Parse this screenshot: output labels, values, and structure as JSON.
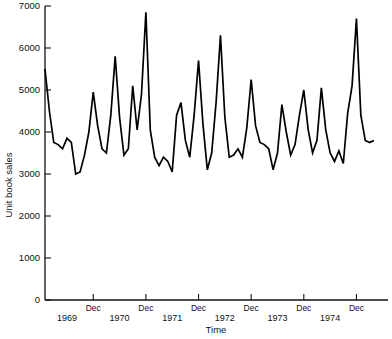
{
  "chart_data": {
    "type": "line",
    "title": "",
    "xlabel": "Time",
    "ylabel": "Unit book sales",
    "ylim": [
      0,
      7000
    ],
    "ytick_values": [
      0,
      1000,
      2000,
      3000,
      4000,
      5000,
      6000,
      7000
    ],
    "ytick_labels": [
      "0",
      "1000",
      "2000",
      "3000",
      "4000",
      "5000",
      "6000",
      "7000"
    ],
    "xtick_labels": [
      "Dec",
      "Dec",
      "Dec",
      "Dec",
      "Dec",
      "Dec"
    ],
    "xtick_x": [
      12,
      24,
      36,
      48,
      60,
      72
    ],
    "year_labels": [
      "1969",
      "1970",
      "1971",
      "1972",
      "1973",
      "1974"
    ],
    "year_x": [
      6,
      18,
      30,
      42,
      54,
      66
    ],
    "xlim": [
      1,
      76
    ],
    "grid": false,
    "legend": false,
    "series": [
      {
        "name": "Unit book sales",
        "color": "#000000",
        "x": [
          1,
          2,
          3,
          4,
          5,
          6,
          7,
          8,
          9,
          10,
          11,
          12,
          13,
          14,
          15,
          16,
          17,
          18,
          19,
          20,
          21,
          22,
          23,
          24,
          25,
          26,
          27,
          28,
          29,
          30,
          31,
          32,
          33,
          34,
          35,
          36,
          37,
          38,
          39,
          40,
          41,
          42,
          43,
          44,
          45,
          46,
          47,
          48,
          49,
          50,
          51,
          52,
          53,
          54,
          55,
          56,
          57,
          58,
          59,
          60,
          61,
          62,
          63,
          64,
          65,
          66,
          67,
          68,
          69,
          70,
          71,
          72,
          73,
          74,
          75,
          76
        ],
        "values": [
          5500,
          4500,
          3750,
          3700,
          3600,
          3850,
          3750,
          3000,
          3050,
          3450,
          4000,
          4950,
          4150,
          3600,
          3500,
          4400,
          5800,
          4350,
          3450,
          3600,
          5100,
          4050,
          4900,
          6850,
          4050,
          3400,
          3200,
          3400,
          3300,
          3050,
          4400,
          4700,
          3800,
          3400,
          4400,
          5700,
          4200,
          3100,
          3500,
          4700,
          6300,
          4350,
          3400,
          3450,
          3600,
          3400,
          4100,
          5250,
          4150,
          3750,
          3700,
          3600,
          3100,
          3500,
          4650,
          4000,
          3450,
          3700,
          4400,
          5000,
          4050,
          3500,
          3800,
          5050,
          4050,
          3500,
          3300,
          3550,
          3250,
          4450,
          5100,
          6700,
          4400,
          3800,
          3750,
          3800
        ]
      }
    ]
  },
  "figure": {
    "background_color": "#ffffff",
    "axis_color": "#111111"
  }
}
